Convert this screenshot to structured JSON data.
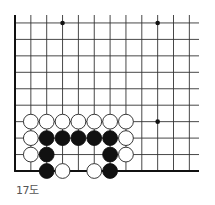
{
  "diagram": {
    "caption": "17도",
    "board": {
      "columns": 12,
      "rows": 10,
      "origin_x": 15,
      "origin_y": 171,
      "spacing_x": 15.85,
      "spacing_y": 16.45,
      "line_extend_right": 199,
      "line_extend_top": 15,
      "edges": [
        "left",
        "bottom"
      ],
      "line_color": "#333333",
      "edge_color": "#111111",
      "star_points": [
        {
          "col": 3,
          "row": 9
        },
        {
          "col": 9,
          "row": 9
        },
        {
          "col": 9,
          "row": 3
        }
      ]
    },
    "stones": [
      {
        "color": "white",
        "col": 1,
        "row": 3
      },
      {
        "color": "white",
        "col": 2,
        "row": 3
      },
      {
        "color": "white",
        "col": 3,
        "row": 3
      },
      {
        "color": "white",
        "col": 4,
        "row": 3
      },
      {
        "color": "white",
        "col": 5,
        "row": 3
      },
      {
        "color": "white",
        "col": 6,
        "row": 3
      },
      {
        "color": "white",
        "col": 7,
        "row": 3
      },
      {
        "color": "white",
        "col": 1,
        "row": 2
      },
      {
        "color": "black",
        "col": 2,
        "row": 2
      },
      {
        "color": "black",
        "col": 3,
        "row": 2
      },
      {
        "color": "black",
        "col": 4,
        "row": 2
      },
      {
        "color": "black",
        "col": 5,
        "row": 2
      },
      {
        "color": "black",
        "col": 6,
        "row": 2
      },
      {
        "color": "white",
        "col": 7,
        "row": 2
      },
      {
        "color": "white",
        "col": 1,
        "row": 1
      },
      {
        "color": "black",
        "col": 2,
        "row": 1
      },
      {
        "color": "black",
        "col": 6,
        "row": 1
      },
      {
        "color": "white",
        "col": 7,
        "row": 1
      },
      {
        "color": "black",
        "col": 2,
        "row": 0
      },
      {
        "color": "white",
        "col": 3,
        "row": 0
      },
      {
        "color": "white",
        "col": 5,
        "row": 0
      },
      {
        "color": "black",
        "col": 6,
        "row": 0
      }
    ],
    "stone_colors": {
      "black": {
        "fill": "#111111",
        "stroke": "#111111"
      },
      "white": {
        "fill": "#ffffff",
        "stroke": "#222222"
      }
    }
  }
}
